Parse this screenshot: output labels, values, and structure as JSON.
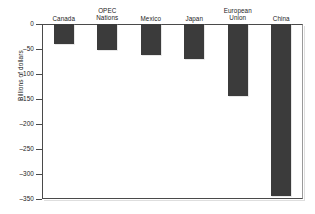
{
  "top_crop_text": "",
  "chart_data": {
    "type": "bar",
    "title": "",
    "xlabel": "",
    "ylabel": "Billions of dollars",
    "categories": [
      "Canada",
      "OPEC\nNations",
      "Mexico",
      "Japan",
      "European\nUnion",
      "China"
    ],
    "values": [
      -40,
      -51,
      -62,
      -69,
      -143,
      -344
    ],
    "ylim": [
      -350,
      0
    ],
    "yticks": [
      0,
      -50,
      -100,
      -150,
      -200,
      -250,
      -300,
      -350
    ],
    "ytick_labels": [
      "0",
      "–50",
      "–100",
      "–150",
      "–200",
      "–250",
      "–300",
      "–350"
    ],
    "grid": false,
    "legend": null,
    "bar_color": "#3b3b3b",
    "axis_color": "#4a4a4a",
    "background": "#ffffff"
  }
}
